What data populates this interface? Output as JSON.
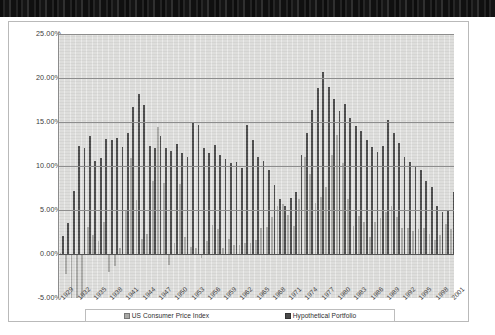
{
  "page": {
    "artifact_label": "scan-artifact-bar",
    "background_color": "#000000",
    "frame_color": "#ffffff"
  },
  "legend": {
    "position": "bottom",
    "items": [
      {
        "label": "US Consumer Price Index",
        "color": "#a9a9a6",
        "marker": "square"
      },
      {
        "label": "Hypothetical Portfolio",
        "color": "#4a4a4a",
        "marker": "square"
      }
    ]
  },
  "axis": {
    "y_ticks": [
      "25.00%",
      "20.00%",
      "15.00%",
      "10.00%",
      "5.00%",
      "0.00%",
      "-5.00%"
    ],
    "x_ticks": [
      "1929",
      "1932",
      "1935",
      "1938",
      "1941",
      "1944",
      "1947",
      "1950",
      "1953",
      "1956",
      "1959",
      "1962",
      "1965",
      "1968",
      "1971",
      "1974",
      "1977",
      "1980",
      "1983",
      "1986",
      "1989",
      "1992",
      "1995",
      "1998",
      "2001"
    ]
  },
  "chart_data": {
    "type": "bar",
    "title": "",
    "subtitle": "",
    "xlabel": "",
    "ylabel": "",
    "ylim": [
      -5,
      25
    ],
    "ytick_step": 5,
    "grid": true,
    "legend_position": "bottom",
    "axis_number_format": "percent",
    "categories": [
      1929,
      1930,
      1931,
      1932,
      1933,
      1934,
      1935,
      1936,
      1937,
      1938,
      1939,
      1940,
      1941,
      1942,
      1943,
      1944,
      1945,
      1946,
      1947,
      1948,
      1949,
      1950,
      1951,
      1952,
      1953,
      1954,
      1955,
      1956,
      1957,
      1958,
      1959,
      1960,
      1961,
      1962,
      1963,
      1964,
      1965,
      1966,
      1967,
      1968,
      1969,
      1970,
      1971,
      1972,
      1973,
      1974,
      1975,
      1976,
      1977,
      1978,
      1979,
      1980,
      1981,
      1982,
      1983,
      1984,
      1985,
      1986,
      1987,
      1988,
      1989,
      1990,
      1991,
      1992,
      1993,
      1994,
      1995,
      1996,
      1997,
      1998,
      1999,
      2000,
      2001
    ],
    "series": [
      {
        "name": "US Consumer Price Index",
        "color": "#a9a9a6",
        "values": [
          0.0,
          -2.3,
          -9.0,
          -9.9,
          -5.1,
          3.1,
          2.2,
          1.5,
          3.6,
          -2.1,
          -1.4,
          0.7,
          5.0,
          10.9,
          6.1,
          1.7,
          2.3,
          8.3,
          14.4,
          8.1,
          -1.2,
          1.3,
          7.9,
          1.9,
          0.8,
          0.7,
          -0.4,
          1.5,
          3.3,
          2.8,
          0.7,
          1.7,
          1.0,
          1.0,
          1.3,
          1.3,
          1.6,
          2.9,
          3.1,
          4.2,
          5.5,
          5.7,
          4.4,
          3.2,
          6.2,
          11.0,
          9.1,
          5.8,
          6.5,
          7.6,
          11.3,
          13.5,
          10.3,
          6.2,
          3.2,
          4.3,
          3.6,
          1.9,
          3.6,
          4.1,
          4.8,
          5.4,
          4.2,
          3.0,
          3.0,
          2.6,
          2.8,
          3.0,
          2.3,
          1.6,
          2.2,
          3.4,
          2.8
        ]
      },
      {
        "name": "Hypothetical Portfolio",
        "color": "#4a4a4a",
        "values": [
          2.0,
          3.5,
          7.2,
          12.3,
          12.0,
          13.4,
          10.6,
          10.9,
          13.1,
          13.0,
          13.2,
          12.2,
          13.8,
          16.7,
          18.2,
          16.9,
          12.3,
          12.0,
          13.4,
          12.1,
          11.7,
          12.5,
          11.5,
          11.0,
          15.0,
          14.7,
          12.0,
          11.5,
          12.4,
          11.3,
          10.8,
          10.3,
          10.4,
          9.8,
          14.7,
          13.0,
          11.0,
          10.6,
          9.5,
          7.8,
          6.3,
          5.4,
          6.4,
          7.0,
          11.2,
          13.8,
          16.4,
          18.9,
          20.7,
          19.0,
          17.6,
          16.3,
          17.1,
          15.4,
          14.6,
          14.0,
          13.0,
          12.2,
          11.6,
          12.3,
          15.2,
          13.8,
          12.6,
          11.0,
          10.5,
          10.0,
          9.5,
          8.3,
          7.6,
          5.4,
          4.8,
          5.0,
          7.0
        ]
      }
    ]
  }
}
